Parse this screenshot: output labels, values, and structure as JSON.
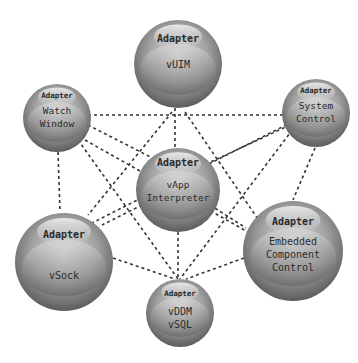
{
  "diagram": {
    "type": "network",
    "nodes": [
      {
        "id": "vuim",
        "badge": "Adapter",
        "lines": [
          "vUIM"
        ]
      },
      {
        "id": "watch",
        "badge": "Adapter",
        "lines": [
          "Watch",
          "Window"
        ]
      },
      {
        "id": "system",
        "badge": "Adapter",
        "lines": [
          "System",
          "Control"
        ]
      },
      {
        "id": "vapp",
        "badge": "Adapter",
        "lines": [
          "vApp",
          "Interpreter"
        ]
      },
      {
        "id": "vsock",
        "badge": "Adapter",
        "lines": [
          "vSock"
        ]
      },
      {
        "id": "embedded",
        "badge": "Adapter",
        "lines": [
          "Embedded",
          "Component",
          "Control"
        ]
      },
      {
        "id": "vddm",
        "badge": "Adapter",
        "lines": [
          "vDDM",
          "vSQL"
        ]
      }
    ],
    "edges": [
      [
        "watch",
        "vuim"
      ],
      [
        "vuim",
        "system"
      ],
      [
        "watch",
        "vapp"
      ],
      [
        "watch",
        "embedded"
      ],
      [
        "watch",
        "vsock"
      ],
      [
        "watch",
        "vddm"
      ],
      [
        "system",
        "vapp"
      ],
      [
        "system",
        "embedded"
      ],
      [
        "system",
        "vsock"
      ],
      [
        "system",
        "vddm"
      ],
      [
        "vuim",
        "vapp"
      ],
      [
        "vuim",
        "vsock"
      ],
      [
        "vuim",
        "embedded"
      ],
      [
        "vapp",
        "vsock"
      ],
      [
        "vapp",
        "embedded"
      ],
      [
        "vapp",
        "vddm"
      ],
      [
        "vsock",
        "vddm"
      ],
      [
        "embedded",
        "vddm"
      ]
    ],
    "edge_style": "dashed",
    "colors": {
      "sphere_light": "#e2e2e2",
      "sphere_dark": "#5e5e5e",
      "edge": "#333333",
      "text": "#2a2a2a"
    }
  }
}
